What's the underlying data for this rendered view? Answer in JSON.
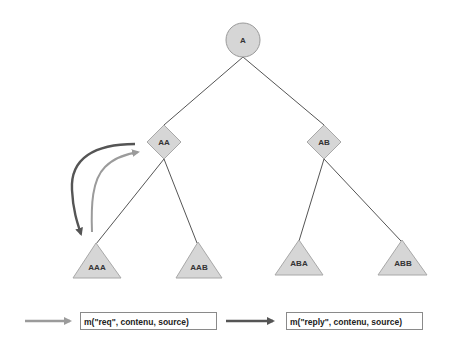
{
  "diagram": {
    "type": "tree",
    "nodes": [
      {
        "id": "A",
        "label": "A",
        "shape": "circle",
        "cx": 243,
        "cy": 40
      },
      {
        "id": "AA",
        "label": "AA",
        "shape": "diamond",
        "cx": 164,
        "cy": 142
      },
      {
        "id": "AB",
        "label": "AB",
        "shape": "diamond",
        "cx": 324,
        "cy": 142
      },
      {
        "id": "AAA",
        "label": "AAA",
        "shape": "triangle",
        "cx": 97,
        "cy": 264
      },
      {
        "id": "AAB",
        "label": "AAB",
        "shape": "triangle",
        "cx": 199,
        "cy": 264
      },
      {
        "id": "ABA",
        "label": "ABA",
        "shape": "triangle",
        "cx": 299,
        "cy": 262
      },
      {
        "id": "ABB",
        "label": "ABB",
        "shape": "triangle",
        "cx": 403,
        "cy": 262
      }
    ],
    "edges": [
      {
        "from": "A",
        "to": "AA"
      },
      {
        "from": "A",
        "to": "AB"
      },
      {
        "from": "AA",
        "to": "AAA"
      },
      {
        "from": "AA",
        "to": "AAB"
      },
      {
        "from": "AB",
        "to": "ABA"
      },
      {
        "from": "AB",
        "to": "ABB"
      }
    ],
    "message_arrows": [
      {
        "from": "AAA",
        "to": "AA",
        "style": "light",
        "meaning": "req"
      },
      {
        "from": "AA",
        "to": "AAA",
        "style": "dark",
        "meaning": "reply"
      }
    ]
  },
  "legend": {
    "request_label": "m(\"req\", contenu, source)",
    "reply_label": "m(\"reply\", contenu, source)"
  },
  "colors": {
    "node_fill": "#d4d4d4",
    "node_stroke": "#9a9a9a",
    "edge": "#555555",
    "arrow_light": "#9b9b9b",
    "arrow_dark": "#555555"
  }
}
